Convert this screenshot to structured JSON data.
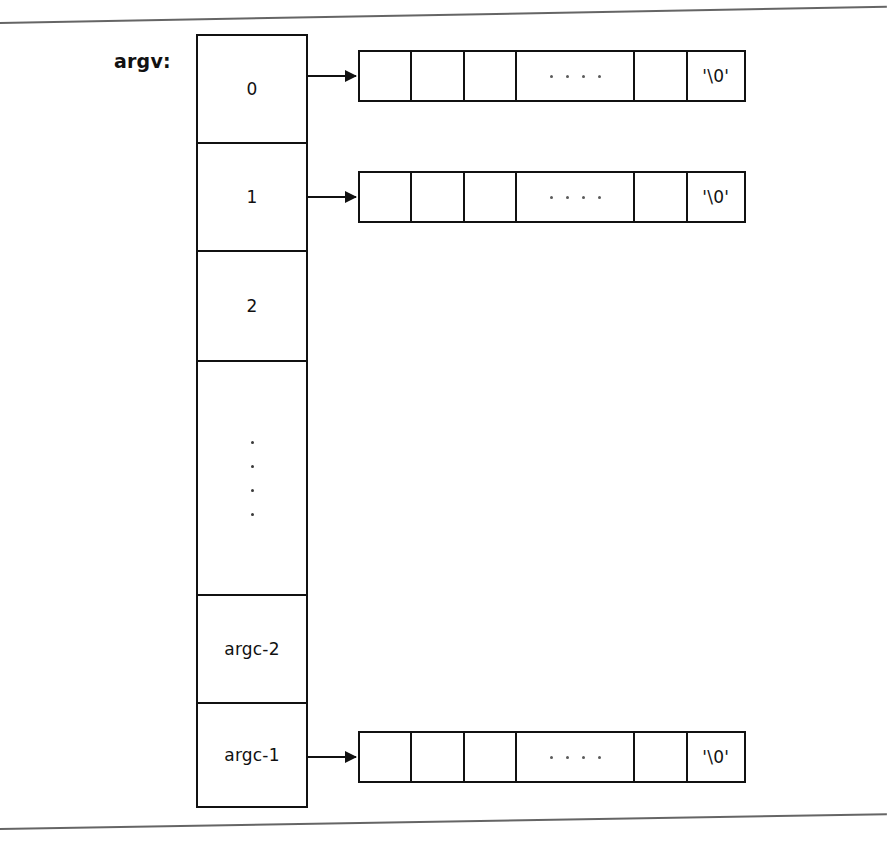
{
  "figure": {
    "label": "argv:",
    "nul_literal": "'\\0'",
    "ink_color": "#111111",
    "background_color": "#ffffff"
  },
  "argv_column": {
    "cells": [
      {
        "label": "0",
        "has_pointer": true
      },
      {
        "label": "1",
        "has_pointer": true
      },
      {
        "label": "2",
        "has_pointer": false
      },
      {
        "label": "",
        "has_pointer": false,
        "ellipsis": "vertical",
        "dot_count": 4
      },
      {
        "label": "argc-2",
        "has_pointer": false
      },
      {
        "label": "argc-1",
        "has_pointer": true
      }
    ]
  },
  "strings": [
    {
      "for_index": "0",
      "cells": [
        {
          "text": "",
          "kind": "narrow"
        },
        {
          "text": "",
          "kind": "narrow"
        },
        {
          "text": "",
          "kind": "narrow"
        },
        {
          "text": "",
          "kind": "wide",
          "ellipsis": "horizontal",
          "dot_count": 4
        },
        {
          "text": "",
          "kind": "narrow"
        },
        {
          "text": "'\\0'",
          "kind": "nul"
        }
      ]
    },
    {
      "for_index": "1",
      "cells": [
        {
          "text": "",
          "kind": "narrow"
        },
        {
          "text": "",
          "kind": "narrow"
        },
        {
          "text": "",
          "kind": "narrow"
        },
        {
          "text": "",
          "kind": "wide",
          "ellipsis": "horizontal",
          "dot_count": 4
        },
        {
          "text": "",
          "kind": "narrow"
        },
        {
          "text": "'\\0'",
          "kind": "nul"
        }
      ]
    },
    {
      "for_index": "argc-1",
      "cells": [
        {
          "text": "",
          "kind": "narrow"
        },
        {
          "text": "",
          "kind": "narrow"
        },
        {
          "text": "",
          "kind": "narrow"
        },
        {
          "text": "",
          "kind": "wide",
          "ellipsis": "horizontal",
          "dot_count": 4
        },
        {
          "text": "",
          "kind": "narrow"
        },
        {
          "text": "'\\0'",
          "kind": "nul"
        }
      ]
    }
  ]
}
